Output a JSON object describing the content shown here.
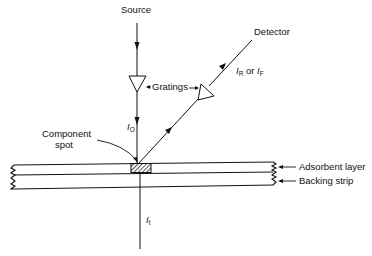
{
  "diagram": {
    "type": "optical-schematic",
    "title": "",
    "labels": {
      "source": "Source",
      "detector": "Detector",
      "gratings": "Gratings",
      "component_spot_line1": "Component",
      "component_spot_line2": "spot",
      "adsorbent_layer": "Adsorbent layer",
      "backing_strip": "Backing strip",
      "incident_intensity": {
        "symbol": "I",
        "subscript": "O"
      },
      "reflected_or_fluorescent": {
        "symbol1": "I",
        "sub1": "R",
        "connector": " or ",
        "symbol2": "I",
        "sub2": "F"
      },
      "transmitted_intensity": {
        "symbol": "I",
        "subscript": "t"
      }
    },
    "nodes": [
      {
        "id": "source",
        "label": "Source"
      },
      {
        "id": "grating-1",
        "label": "Grating"
      },
      {
        "id": "component-spot",
        "label": "Component spot"
      },
      {
        "id": "grating-2",
        "label": "Grating"
      },
      {
        "id": "detector",
        "label": "Detector"
      },
      {
        "id": "transmitted",
        "label": "It"
      }
    ],
    "edges": [
      {
        "from": "source",
        "to": "grating-1",
        "arrow": "down"
      },
      {
        "from": "grating-1",
        "to": "component-spot",
        "label": "IO",
        "arrow": "down"
      },
      {
        "from": "component-spot",
        "to": "grating-2",
        "arrow": "up-right"
      },
      {
        "from": "grating-2",
        "to": "detector",
        "label": "IR or IF",
        "arrow": "up-right"
      },
      {
        "from": "component-spot",
        "to": "transmitted",
        "label": "It"
      }
    ],
    "layers": [
      {
        "name": "Adsorbent layer"
      },
      {
        "name": "Backing strip"
      }
    ],
    "colors": {
      "ink": "#111111",
      "background": "#ffffff"
    }
  }
}
